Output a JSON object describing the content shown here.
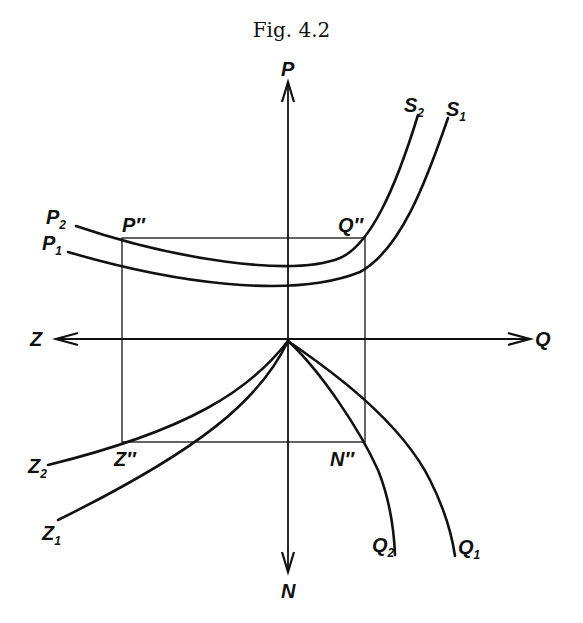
{
  "figure": {
    "title": "Fig. 4.2"
  },
  "axes": {
    "up": "P",
    "down": "N",
    "left": "Z",
    "right": "Q"
  },
  "rectangle_corners": {
    "top_left": "P″",
    "top_right": "Q″",
    "bottom_left": "Z″",
    "bottom_right": "N″"
  },
  "curves": {
    "p1": {
      "base": "P",
      "sub": "1"
    },
    "p2": {
      "base": "P",
      "sub": "2"
    },
    "s1": {
      "base": "S",
      "sub": "1"
    },
    "s2": {
      "base": "S",
      "sub": "2"
    },
    "z1": {
      "base": "Z",
      "sub": "1"
    },
    "z2": {
      "base": "Z",
      "sub": "2"
    },
    "q1": {
      "base": "Q",
      "sub": "1"
    },
    "q2": {
      "base": "Q",
      "sub": "2"
    }
  }
}
